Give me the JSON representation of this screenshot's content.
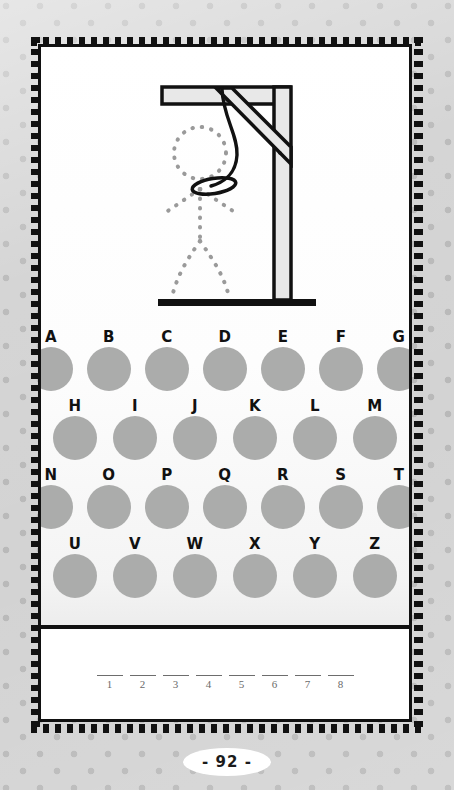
{
  "page": {
    "page_number_label": "- 92 -",
    "background_color": "#d3d3d3",
    "paper_color": "#ffffff",
    "border_color": "#111111"
  },
  "illustration": {
    "name": "hangman-gallows",
    "description": "Gallows with noose and dotted stick figure outline",
    "beam_fill": "#e8e8e8",
    "beam_stroke": "#111111",
    "figure_style": "dotted",
    "figure_color": "#9a9a9a",
    "rope_color": "#111111",
    "parts": [
      "top-beam",
      "diagonal-brace",
      "vertical-post",
      "ground-bar",
      "rope",
      "noose-loop",
      "head",
      "left-arm",
      "right-arm",
      "torso",
      "left-leg",
      "right-leg"
    ]
  },
  "keypad": {
    "circle_color": "#abacab",
    "label_color": "#111111",
    "rows": [
      {
        "indent": 0,
        "letters": [
          "A",
          "B",
          "C",
          "D",
          "E",
          "F",
          "G"
        ]
      },
      {
        "indent": 1,
        "letters": [
          "H",
          "I",
          "J",
          "K",
          "L",
          "M"
        ]
      },
      {
        "indent": 0,
        "letters": [
          "N",
          "O",
          "P",
          "Q",
          "R",
          "S",
          "T"
        ]
      },
      {
        "indent": 1,
        "letters": [
          "U",
          "V",
          "W",
          "X",
          "Y",
          "Z"
        ]
      }
    ]
  },
  "answer": {
    "line_color": "#6d6d6d",
    "number_color": "#6a6a6a",
    "blanks": [
      {
        "number": "1",
        "value": ""
      },
      {
        "number": "2",
        "value": ""
      },
      {
        "number": "3",
        "value": ""
      },
      {
        "number": "4",
        "value": ""
      },
      {
        "number": "5",
        "value": ""
      },
      {
        "number": "6",
        "value": ""
      },
      {
        "number": "7",
        "value": ""
      },
      {
        "number": "8",
        "value": ""
      }
    ]
  }
}
